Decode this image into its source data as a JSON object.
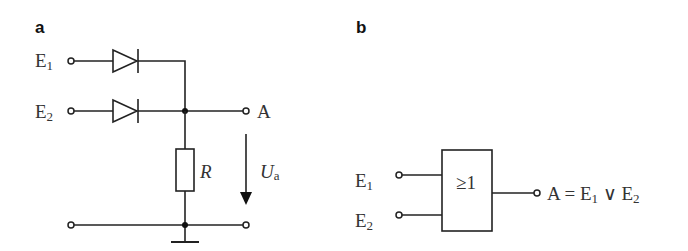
{
  "panels": {
    "a": {
      "label": "a",
      "inputs": [
        {
          "name": "E",
          "sub": "1"
        },
        {
          "name": "E",
          "sub": "2"
        }
      ],
      "output": {
        "name": "A"
      },
      "resistor": {
        "name": "R"
      },
      "voltage": {
        "name": "U",
        "sub": "a"
      },
      "components": [
        "diode",
        "diode",
        "resistor",
        "ground"
      ]
    },
    "b": {
      "label": "b",
      "inputs": [
        {
          "name": "E",
          "sub": "1"
        },
        {
          "name": "E",
          "sub": "2"
        }
      ],
      "gate": {
        "symbol": "≥1",
        "type": "OR"
      },
      "output": {
        "prefix": "A = E",
        "sub1": "1",
        "op": " ∨ E",
        "sub2": "2"
      }
    }
  },
  "colors": {
    "line": "#222222",
    "text": "#333333",
    "background": "#ffffff"
  }
}
